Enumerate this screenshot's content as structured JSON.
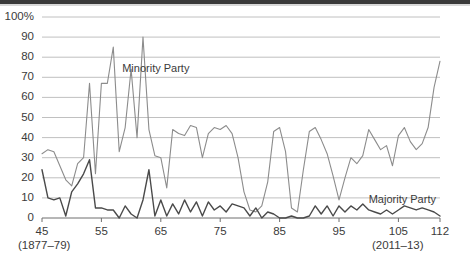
{
  "chart_data": {
    "type": "line",
    "title": "",
    "subtitle": "",
    "xlabel": "",
    "ylabel": "",
    "grid": true,
    "legend_position": "inline-annotations",
    "xlim": [
      45,
      112
    ],
    "ylim": [
      0,
      100
    ],
    "y_ticks": [
      0,
      10,
      20,
      30,
      40,
      50,
      60,
      70,
      80,
      90,
      100
    ],
    "y_tick_labels": [
      "0",
      "10",
      "20",
      "30",
      "40",
      "50",
      "60",
      "70",
      "80",
      "90",
      "100%"
    ],
    "x_ticks": [
      45,
      55,
      65,
      75,
      85,
      95,
      105,
      112
    ],
    "x_tick_labels": [
      "45",
      "55",
      "65",
      "75",
      "85",
      "95",
      "105",
      "112"
    ],
    "x_range_start_note": "(1877–79)",
    "x_range_end_note": "(2011–13)",
    "annotations": [
      {
        "text": "Minority Party",
        "x": 58.5,
        "y": 74
      },
      {
        "text": "Majority Party",
        "x": 100.0,
        "y": 9
      }
    ],
    "x": [
      45,
      46,
      47,
      48,
      49,
      50,
      51,
      52,
      53,
      54,
      55,
      56,
      57,
      58,
      59,
      60,
      61,
      62,
      63,
      64,
      65,
      66,
      67,
      68,
      69,
      70,
      71,
      72,
      73,
      74,
      75,
      76,
      77,
      78,
      79,
      80,
      81,
      82,
      83,
      84,
      85,
      86,
      87,
      88,
      89,
      90,
      91,
      92,
      93,
      94,
      95,
      96,
      97,
      98,
      99,
      100,
      101,
      102,
      103,
      104,
      105,
      106,
      107,
      108,
      109,
      110,
      111,
      112
    ],
    "series": [
      {
        "name": "Minority Party",
        "color": "#8c8c8c",
        "values": [
          32,
          34,
          33,
          26,
          19,
          16,
          27,
          30,
          67,
          22,
          67,
          67,
          85,
          33,
          45,
          74,
          40,
          90,
          44,
          31,
          30,
          15,
          44,
          42,
          41,
          46,
          45,
          30,
          42,
          45,
          44,
          46,
          42,
          30,
          13,
          4,
          3,
          6,
          18,
          43,
          45,
          33,
          5,
          3,
          24,
          43,
          45,
          39,
          32,
          21,
          9,
          20,
          30,
          27,
          31,
          44,
          39,
          34,
          36,
          26,
          41,
          45,
          38,
          34,
          37,
          45,
          65,
          78
        ]
      },
      {
        "name": "Majority Party",
        "color": "#4a4a4a",
        "values": [
          24,
          10,
          9,
          10,
          1,
          13,
          17,
          22,
          29,
          5,
          5,
          4,
          4,
          0,
          6,
          2,
          0,
          9,
          24,
          1,
          9,
          1,
          7,
          2,
          9,
          3,
          8,
          1,
          8,
          4,
          6,
          3,
          7,
          6,
          5,
          1,
          5,
          0,
          3,
          2,
          0,
          0,
          1,
          0,
          0,
          1,
          6,
          2,
          6,
          1,
          6,
          3,
          6,
          4,
          7,
          4,
          3,
          2,
          4,
          2,
          4,
          6,
          5,
          4,
          5,
          4,
          3,
          1
        ]
      }
    ]
  }
}
